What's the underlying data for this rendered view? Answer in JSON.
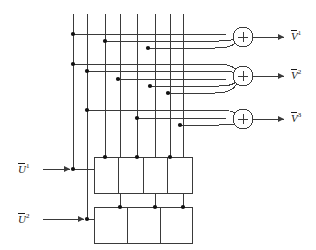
{
  "diagram": {
    "colors": {
      "line": "#3a3a3a",
      "dot": "#111111",
      "text": "#1a1a1a",
      "background": "#ffffff"
    },
    "inputs": [
      {
        "name": "input-u1",
        "label_base": "U",
        "label_sup": "1",
        "overbar": true,
        "x": 18,
        "y": 169
      },
      {
        "name": "input-u2",
        "label_base": "U",
        "label_sup": "2",
        "overbar": true,
        "x": 18,
        "y": 219
      }
    ],
    "outputs": [
      {
        "name": "output-v1",
        "label_base": "V",
        "label_sup": "1",
        "overbar": true,
        "x": 291,
        "y": 34
      },
      {
        "name": "output-v2",
        "label_base": "V",
        "label_sup": "2",
        "overbar": true,
        "x": 291,
        "y": 73
      },
      {
        "name": "output-v3",
        "label_base": "V",
        "label_sup": "3",
        "overbar": true,
        "x": 291,
        "y": 116
      }
    ],
    "summing_junctions": [
      {
        "name": "summing-junction-1",
        "symbol": "+",
        "cx": 243,
        "cy": 37,
        "r": 10,
        "inputs": 3
      },
      {
        "name": "summing-junction-2",
        "symbol": "+",
        "cx": 243,
        "cy": 76,
        "r": 10,
        "inputs": 4
      },
      {
        "name": "summing-junction-3",
        "symbol": "+",
        "cx": 243,
        "cy": 119,
        "r": 10,
        "inputs": 3
      }
    ],
    "delay_blocks": [
      {
        "name": "delay-block-upper",
        "x": 94,
        "y": 157,
        "width": 98,
        "height": 36,
        "cells": 4,
        "taps": 3
      },
      {
        "name": "delay-block-lower",
        "x": 94,
        "y": 207,
        "width": 98,
        "height": 36,
        "cells": 3,
        "taps": 3
      }
    ],
    "vertical_tap_lines": [
      73,
      87,
      105,
      120,
      137,
      155,
      170,
      183
    ],
    "bus_rows": [
      {
        "name": "bus-row-1",
        "y": 34,
        "tap_x": 73
      },
      {
        "name": "bus-row-2",
        "y": 41,
        "tap_x": 105
      },
      {
        "name": "bus-row-3",
        "y": 48,
        "tap_x": 148
      },
      {
        "name": "bus-row-4",
        "y": 64,
        "tap_x": 73
      },
      {
        "name": "bus-row-5",
        "y": 71,
        "tap_x": 87
      },
      {
        "name": "bus-row-6",
        "y": 79,
        "tap_x": 118
      },
      {
        "name": "bus-row-7",
        "y": 86,
        "tap_x": 150
      },
      {
        "name": "bus-row-8",
        "y": 93,
        "tap_x": 168
      },
      {
        "name": "bus-row-9",
        "y": 110,
        "tap_x": 87
      },
      {
        "name": "bus-row-10",
        "y": 118,
        "tap_x": 137
      },
      {
        "name": "bus-row-11",
        "y": 125,
        "tap_x": 180
      }
    ]
  }
}
